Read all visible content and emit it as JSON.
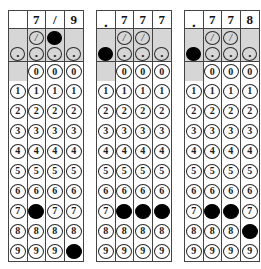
{
  "document": {
    "type": "gridded-response answer grids",
    "panel_count": 3,
    "columns_per_panel": 4
  },
  "symbols": {
    "slash": "/",
    "dot": ".",
    "blank": ""
  },
  "digits": [
    "0",
    "1",
    "2",
    "3",
    "4",
    "5",
    "6",
    "7",
    "8",
    "9"
  ],
  "colors": {
    "shaded_cell": "#d6d6d6",
    "filled_bubble": "#000000",
    "grid_line": "#444444",
    "paper": "#ffffff"
  },
  "panels": [
    {
      "id": "panel-1",
      "answer": "7/9",
      "header": [
        "",
        "7",
        "/",
        "9"
      ],
      "slash_row": {
        "present": [
          false,
          true,
          true,
          false
        ],
        "filled": [
          false,
          false,
          true,
          false
        ]
      },
      "dot_row": {
        "present": [
          true,
          true,
          true,
          true
        ],
        "filled": [
          false,
          false,
          false,
          false
        ]
      },
      "digit_rows": [
        {
          "digit": "0",
          "present": [
            false,
            true,
            true,
            true
          ],
          "filled": [
            false,
            false,
            false,
            false
          ]
        },
        {
          "digit": "1",
          "present": [
            true,
            true,
            true,
            true
          ],
          "filled": [
            false,
            false,
            false,
            false
          ]
        },
        {
          "digit": "2",
          "present": [
            true,
            true,
            true,
            true
          ],
          "filled": [
            false,
            false,
            false,
            false
          ]
        },
        {
          "digit": "3",
          "present": [
            true,
            true,
            true,
            true
          ],
          "filled": [
            false,
            false,
            false,
            false
          ]
        },
        {
          "digit": "4",
          "present": [
            true,
            true,
            true,
            true
          ],
          "filled": [
            false,
            false,
            false,
            false
          ]
        },
        {
          "digit": "5",
          "present": [
            true,
            true,
            true,
            true
          ],
          "filled": [
            false,
            false,
            false,
            false
          ]
        },
        {
          "digit": "6",
          "present": [
            true,
            true,
            true,
            true
          ],
          "filled": [
            false,
            false,
            false,
            false
          ]
        },
        {
          "digit": "7",
          "present": [
            true,
            true,
            true,
            true
          ],
          "filled": [
            false,
            true,
            false,
            false
          ]
        },
        {
          "digit": "8",
          "present": [
            true,
            true,
            true,
            true
          ],
          "filled": [
            false,
            false,
            false,
            false
          ]
        },
        {
          "digit": "9",
          "present": [
            true,
            true,
            true,
            true
          ],
          "filled": [
            false,
            false,
            false,
            true
          ]
        }
      ]
    },
    {
      "id": "panel-2",
      "answer": ".777",
      "header": [
        ".",
        "7",
        "7",
        "7"
      ],
      "slash_row": {
        "present": [
          false,
          true,
          true,
          false
        ],
        "filled": [
          false,
          false,
          false,
          false
        ]
      },
      "dot_row": {
        "present": [
          true,
          true,
          true,
          true
        ],
        "filled": [
          true,
          false,
          false,
          false
        ]
      },
      "digit_rows": [
        {
          "digit": "0",
          "present": [
            false,
            true,
            true,
            true
          ],
          "filled": [
            false,
            false,
            false,
            false
          ]
        },
        {
          "digit": "1",
          "present": [
            true,
            true,
            true,
            true
          ],
          "filled": [
            false,
            false,
            false,
            false
          ]
        },
        {
          "digit": "2",
          "present": [
            true,
            true,
            true,
            true
          ],
          "filled": [
            false,
            false,
            false,
            false
          ]
        },
        {
          "digit": "3",
          "present": [
            true,
            true,
            true,
            true
          ],
          "filled": [
            false,
            false,
            false,
            false
          ]
        },
        {
          "digit": "4",
          "present": [
            true,
            true,
            true,
            true
          ],
          "filled": [
            false,
            false,
            false,
            false
          ]
        },
        {
          "digit": "5",
          "present": [
            true,
            true,
            true,
            true
          ],
          "filled": [
            false,
            false,
            false,
            false
          ]
        },
        {
          "digit": "6",
          "present": [
            true,
            true,
            true,
            true
          ],
          "filled": [
            false,
            false,
            false,
            false
          ]
        },
        {
          "digit": "7",
          "present": [
            true,
            true,
            true,
            true
          ],
          "filled": [
            false,
            true,
            true,
            true
          ]
        },
        {
          "digit": "8",
          "present": [
            true,
            true,
            true,
            true
          ],
          "filled": [
            false,
            false,
            false,
            false
          ]
        },
        {
          "digit": "9",
          "present": [
            true,
            true,
            true,
            true
          ],
          "filled": [
            false,
            false,
            false,
            false
          ]
        }
      ]
    },
    {
      "id": "panel-3",
      "answer": ".778",
      "header": [
        ".",
        "7",
        "7",
        "8"
      ],
      "slash_row": {
        "present": [
          false,
          true,
          true,
          false
        ],
        "filled": [
          false,
          false,
          false,
          false
        ]
      },
      "dot_row": {
        "present": [
          true,
          true,
          true,
          true
        ],
        "filled": [
          true,
          false,
          false,
          false
        ]
      },
      "digit_rows": [
        {
          "digit": "0",
          "present": [
            false,
            true,
            true,
            true
          ],
          "filled": [
            false,
            false,
            false,
            false
          ]
        },
        {
          "digit": "1",
          "present": [
            true,
            true,
            true,
            true
          ],
          "filled": [
            false,
            false,
            false,
            false
          ]
        },
        {
          "digit": "2",
          "present": [
            true,
            true,
            true,
            true
          ],
          "filled": [
            false,
            false,
            false,
            false
          ]
        },
        {
          "digit": "3",
          "present": [
            true,
            true,
            true,
            true
          ],
          "filled": [
            false,
            false,
            false,
            false
          ]
        },
        {
          "digit": "4",
          "present": [
            true,
            true,
            true,
            true
          ],
          "filled": [
            false,
            false,
            false,
            false
          ]
        },
        {
          "digit": "5",
          "present": [
            true,
            true,
            true,
            true
          ],
          "filled": [
            false,
            false,
            false,
            false
          ]
        },
        {
          "digit": "6",
          "present": [
            true,
            true,
            true,
            true
          ],
          "filled": [
            false,
            false,
            false,
            false
          ]
        },
        {
          "digit": "7",
          "present": [
            true,
            true,
            true,
            true
          ],
          "filled": [
            false,
            true,
            true,
            false
          ]
        },
        {
          "digit": "8",
          "present": [
            true,
            true,
            true,
            true
          ],
          "filled": [
            false,
            false,
            false,
            true
          ]
        },
        {
          "digit": "9",
          "present": [
            true,
            true,
            true,
            true
          ],
          "filled": [
            false,
            false,
            false,
            false
          ]
        }
      ]
    }
  ]
}
